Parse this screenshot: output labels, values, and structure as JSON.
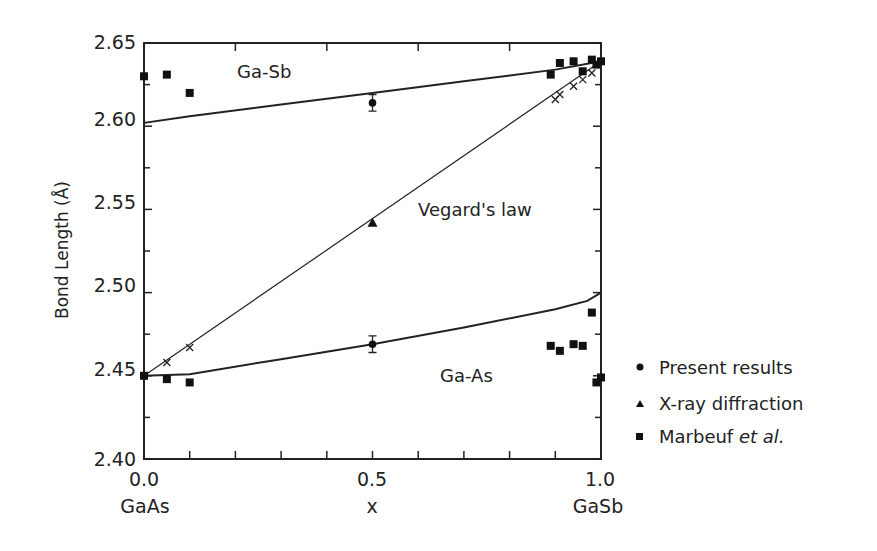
{
  "chart_data": {
    "type": "line",
    "title": "",
    "xlabel": "x",
    "ylabel": "Bond Length (Å)",
    "xlim": [
      0.0,
      1.0
    ],
    "ylim": [
      2.4,
      2.65
    ],
    "x_ticks": [
      "0.0",
      "0.5",
      "1.0"
    ],
    "x_tick_sublabels": [
      "GaAs",
      "",
      "GaSb"
    ],
    "y_ticks": [
      "2.40",
      "2.45",
      "2.50",
      "2.55",
      "2.60",
      "2.65"
    ],
    "grid": false,
    "legend_position": "right",
    "legend": [
      {
        "marker": "circle",
        "label": "Present results"
      },
      {
        "marker": "triangle",
        "label": "X-ray diffraction"
      },
      {
        "marker": "square",
        "label": "Marbeuf et al."
      }
    ],
    "annotations": [
      "Ga-Sb",
      "Vegard's law",
      "Ga-As"
    ],
    "series": [
      {
        "name": "Ga-Sb (theory curve)",
        "style": "solid",
        "x": [
          0.0,
          0.1,
          0.3,
          0.5,
          0.7,
          0.9,
          1.0
        ],
        "y": [
          2.602,
          2.606,
          2.613,
          2.62,
          2.627,
          2.634,
          2.639
        ]
      },
      {
        "name": "Ga-As (theory curve)",
        "style": "solid",
        "x": [
          0.0,
          0.1,
          0.3,
          0.5,
          0.7,
          0.9,
          0.97,
          1.0
        ],
        "y": [
          2.45,
          2.451,
          2.46,
          2.469,
          2.479,
          2.49,
          2.495,
          2.5
        ]
      },
      {
        "name": "Vegard's law",
        "style": "thin-solid",
        "x": [
          0.0,
          1.0
        ],
        "y": [
          2.45,
          2.639
        ]
      },
      {
        "name": "Vegard crosses",
        "marker": "x",
        "x": [
          0.05,
          0.1,
          0.9,
          0.91,
          0.94,
          0.96,
          0.98
        ],
        "y": [
          2.458,
          2.467,
          2.616,
          2.619,
          2.624,
          2.628,
          2.632
        ]
      },
      {
        "name": "Present results",
        "marker": "circle",
        "x": [
          0.5,
          0.5
        ],
        "y": [
          2.614,
          2.469
        ],
        "error": [
          0.005,
          0.005
        ]
      },
      {
        "name": "X-ray diffraction",
        "marker": "triangle",
        "x": [
          0.5
        ],
        "y": [
          2.542
        ]
      },
      {
        "name": "Marbeuf et al.",
        "marker": "square",
        "x": [
          0.0,
          0.05,
          0.1,
          0.89,
          0.91,
          0.94,
          0.96,
          0.98,
          0.99,
          1.0,
          0.0,
          0.05,
          0.1,
          0.89,
          0.91,
          0.94,
          0.96,
          0.98,
          0.99,
          1.0
        ],
        "y": [
          2.63,
          2.631,
          2.62,
          2.631,
          2.638,
          2.639,
          2.633,
          2.64,
          2.637,
          2.639,
          2.45,
          2.448,
          2.446,
          2.468,
          2.465,
          2.469,
          2.468,
          2.488,
          2.446,
          2.449
        ]
      }
    ]
  },
  "labels": {
    "y_axis_title": "Bond Length (Å)",
    "x_axis_title": "x",
    "x_left_sub": "GaAs",
    "x_right_sub": "GaSb",
    "ga_sb": "Ga-Sb",
    "vegard": "Vegard's law",
    "ga_as": "Ga-As",
    "legend_present": "Present results",
    "legend_xray": "X-ray diffraction",
    "legend_marbeuf_main": "Marbeuf ",
    "legend_marbeuf_italic": "et al."
  }
}
